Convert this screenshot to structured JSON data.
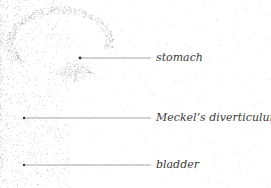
{
  "figure": {
    "type": "stippled anatomical illustration",
    "colors": {
      "stipple": "#8a8a8a",
      "leader": "#555555",
      "text": "#3a3a3a"
    },
    "labels": [
      {
        "text": "stomach",
        "dot": [
          80,
          58
        ],
        "line_end": [
          151,
          58
        ],
        "text_pos": [
          156,
          52
        ]
      },
      {
        "text": "Meckel’s diverticulum",
        "dot": [
          24,
          118
        ],
        "line_end": [
          151,
          118
        ],
        "text_pos": [
          156,
          112
        ]
      },
      {
        "text": "bladder",
        "dot": [
          24,
          165
        ],
        "line_end": [
          151,
          165
        ],
        "text_pos": [
          156,
          159
        ]
      }
    ]
  }
}
